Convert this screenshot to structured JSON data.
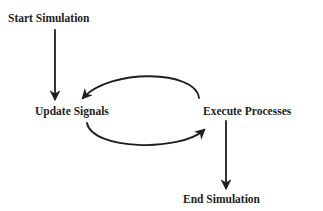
{
  "diagram": {
    "type": "flowchart",
    "nodes": [
      {
        "id": "start",
        "label": "Start Simulation"
      },
      {
        "id": "update",
        "label": "Update Signals"
      },
      {
        "id": "execute",
        "label": "Execute Processes"
      },
      {
        "id": "end",
        "label": "End Simulation"
      }
    ],
    "edges": [
      {
        "from": "start",
        "to": "update",
        "style": "straight"
      },
      {
        "from": "execute",
        "to": "update",
        "style": "curved-top"
      },
      {
        "from": "update",
        "to": "execute",
        "style": "curved-bottom"
      },
      {
        "from": "execute",
        "to": "end",
        "style": "straight"
      }
    ],
    "colors": {
      "ink": "#1e1e1e",
      "background": "#ffffff"
    }
  }
}
